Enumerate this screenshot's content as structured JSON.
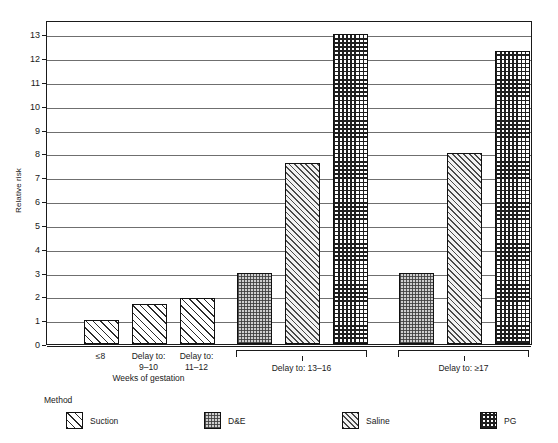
{
  "chart_data": {
    "type": "bar",
    "title": "",
    "subtitle": "",
    "xlabel": "Weeks of gestation",
    "ylabel": "Relative risk",
    "ylim": [
      0,
      13.6
    ],
    "yticks": [
      0,
      1,
      2,
      3,
      4,
      5,
      6,
      7,
      8,
      9,
      10,
      11,
      12,
      13
    ],
    "ytick_labels": [
      "0",
      "1",
      "2",
      "3",
      "4",
      "5",
      "6",
      "7",
      "8",
      "9",
      "10",
      "11",
      "12",
      "13"
    ],
    "grid": "horizontal",
    "legend_position": "bottom-left",
    "legend_title": "Method",
    "series": [
      {
        "name": "Suction",
        "pattern": "diagonal-hatch-wide"
      },
      {
        "name": "D&E",
        "pattern": "fine-checker-gray"
      },
      {
        "name": "Saline",
        "pattern": "diagonal-hatch-fine"
      },
      {
        "name": "PG",
        "pattern": "grid-crosshatch-dense"
      }
    ],
    "groups": [
      {
        "id": "group-weeks",
        "bracket": false,
        "label": "",
        "categories": [
          {
            "label": "≤8",
            "series": "Suction",
            "value": 1.0
          },
          {
            "label": "Delay to:\n9–10",
            "series": "Suction",
            "value": 1.7
          },
          {
            "label": "Delay to:\n11–12",
            "series": "Suction",
            "value": 1.95
          }
        ]
      },
      {
        "id": "group-delay-13-16",
        "bracket": true,
        "label": "Delay to:  13–16",
        "categories": [
          {
            "label": "D&E",
            "series": "D&E",
            "value": 3.0
          },
          {
            "label": "Saline",
            "series": "Saline",
            "value": 7.6
          },
          {
            "label": "PG",
            "series": "PG",
            "value": 13.0
          }
        ]
      },
      {
        "id": "group-delay-17",
        "bracket": true,
        "label": "Delay to:  ≥17",
        "categories": [
          {
            "label": "D&E",
            "series": "D&E",
            "value": 3.0
          },
          {
            "label": "Saline",
            "series": "Saline",
            "value": 8.0
          },
          {
            "label": "PG",
            "series": "PG",
            "value": 12.3
          }
        ]
      }
    ]
  },
  "axis": {
    "y_title": "Relative risk",
    "x_title": "Weeks of gestation",
    "y_labels": [
      "13",
      "12",
      "11",
      "10",
      "9",
      "8",
      "7",
      "6",
      "5",
      "4",
      "3",
      "2",
      "1",
      "0"
    ]
  },
  "x_labels": {
    "cat_1_line1": "≤8",
    "cat_1_line2": "",
    "cat_2_line1": "Delay to:",
    "cat_2_line2": "9–10",
    "cat_3_line1": "Delay to:",
    "cat_3_line2": "11–12",
    "group_2": "Delay to:  13–16",
    "group_3": "Delay to:  ≥17"
  },
  "legend": {
    "title": "Method",
    "items": [
      {
        "label": "Suction",
        "swatch": "diagonal-hatch-wide"
      },
      {
        "label": "D&E",
        "swatch": "fine-checker-gray"
      },
      {
        "label": "Saline",
        "swatch": "diagonal-hatch-fine"
      },
      {
        "label": "PG",
        "swatch": "grid-crosshatch-dense"
      }
    ]
  },
  "colors": {
    "axis": "#1a1a1a",
    "gridline": "#6f6f6f",
    "background": "#ffffff",
    "de_fill": "#cfcfcf"
  }
}
